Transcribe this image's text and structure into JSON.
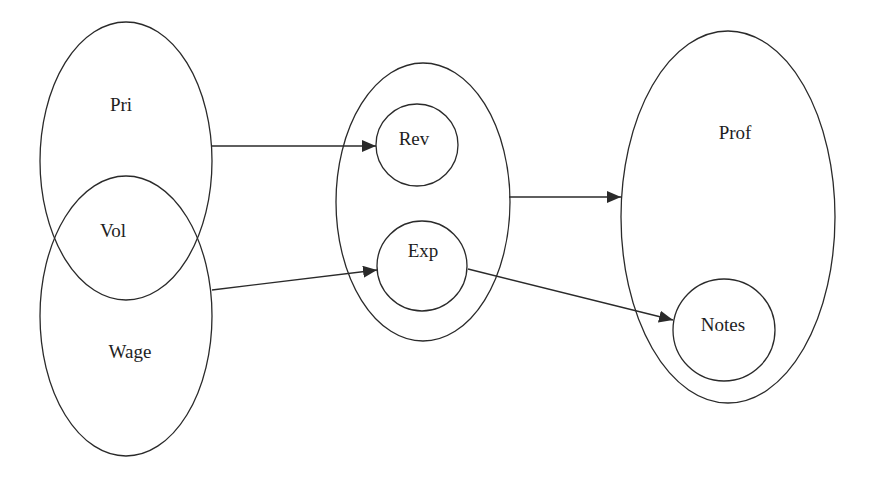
{
  "diagram": {
    "nodes": {
      "pri": {
        "label": "Pri",
        "cx": 126,
        "cy": 161,
        "rx": 86,
        "ry": 139,
        "lx": 121,
        "ly": 111
      },
      "wage": {
        "label": "Wage",
        "cx": 126,
        "cy": 316,
        "rx": 86,
        "ry": 140,
        "lx": 130,
        "ly": 358
      },
      "vol": {
        "label": "Vol",
        "lx": 113,
        "ly": 237
      },
      "group": {
        "label": "",
        "cx": 423,
        "cy": 202,
        "rx": 87,
        "ry": 139
      },
      "rev": {
        "label": "Rev",
        "cx": 417,
        "cy": 145,
        "r": 41,
        "lx": 414,
        "ly": 145
      },
      "exp": {
        "label": "Exp",
        "cx": 422,
        "cy": 266,
        "r": 45,
        "lx": 423,
        "ly": 257
      },
      "prof": {
        "label": "Prof",
        "cx": 728,
        "cy": 217,
        "rx": 107,
        "ry": 186,
        "lx": 735,
        "ly": 139
      },
      "notes": {
        "label": "Notes",
        "cx": 724,
        "cy": 330,
        "r": 51,
        "lx": 723,
        "ly": 331
      }
    },
    "edges": [
      {
        "from": "pri",
        "to": "rev",
        "x1": 212,
        "y1": 146,
        "x2": 376,
        "y2": 146
      },
      {
        "from": "wage",
        "to": "exp",
        "x1": 212,
        "y1": 290,
        "x2": 377,
        "y2": 270
      },
      {
        "from": "group",
        "to": "prof",
        "x1": 509,
        "y1": 197,
        "x2": 621,
        "y2": 197
      },
      {
        "from": "exp",
        "to": "notes",
        "x1": 468,
        "y1": 269,
        "x2": 673,
        "y2": 320
      }
    ],
    "colors": {
      "stroke": "#2a2a2a",
      "text": "#1e1e1e",
      "background": "#ffffff"
    }
  }
}
